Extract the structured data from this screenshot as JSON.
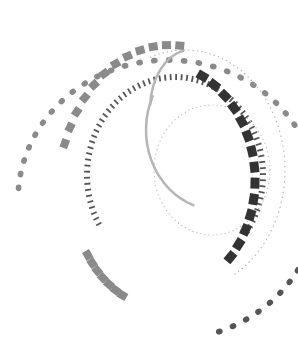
{
  "artwork": {
    "description": "Abstract decorative graphic of concentric dashed and dotted circular arcs in grayscale",
    "palette": {
      "background": "#ffffff",
      "light_gray": "#b5b5b5",
      "mid_gray": "#8a8a8a",
      "dark_gray": "#555555",
      "charcoal": "#333333"
    },
    "rings": [
      {
        "name": "outer-dot-ring",
        "style": "dots",
        "color": "mid_gray"
      },
      {
        "name": "thick-dash-ring-left",
        "style": "thick-dashes",
        "color": "mid_gray"
      },
      {
        "name": "thin-dash-ring-inner",
        "style": "thin-dashes",
        "color": "dark_gray"
      },
      {
        "name": "fine-dot-ring",
        "style": "fine-dots",
        "color": "light_gray"
      },
      {
        "name": "solid-arc-thin",
        "style": "solid",
        "color": "light_gray"
      },
      {
        "name": "dark-block-ring-right",
        "style": "blocks",
        "color": "charcoal"
      }
    ]
  }
}
